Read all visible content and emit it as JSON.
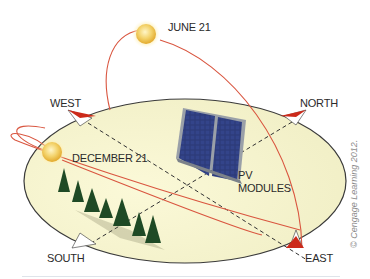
{
  "diagram": {
    "labels": {
      "june": "JUNE 21",
      "december": "DECEMBER 21",
      "west": "WEST",
      "north": "NORTH",
      "south": "SOUTH",
      "east": "EAST",
      "pv_line1": "PV",
      "pv_line2": "MODULES"
    },
    "copyright": "© Cengage Learning 2012.",
    "colors": {
      "sun_path": "#d9553f",
      "ellipse_fill": "#f8f6d6",
      "ellipse_stroke": "#3a3a3a",
      "panel": "#2a3568",
      "sun": "#f2c94c",
      "tree": "#1f4a25",
      "arrow_red": "#cc2a1a"
    }
  }
}
